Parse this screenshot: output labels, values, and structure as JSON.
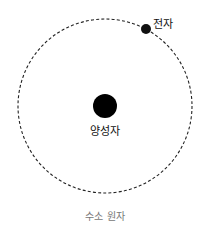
{
  "diagram": {
    "title": "수소 원자",
    "orbit": {
      "cx": 105,
      "cy": 106,
      "r": 87,
      "stroke": "#222222",
      "dash": "3 2.2"
    },
    "nucleus": {
      "label": "양성자",
      "cx": 105,
      "cy": 106,
      "r": 12,
      "fill": "#000000"
    },
    "electron": {
      "label": "전자",
      "cx": 146,
      "cy": 29,
      "r": 5,
      "fill": "#111111"
    }
  }
}
